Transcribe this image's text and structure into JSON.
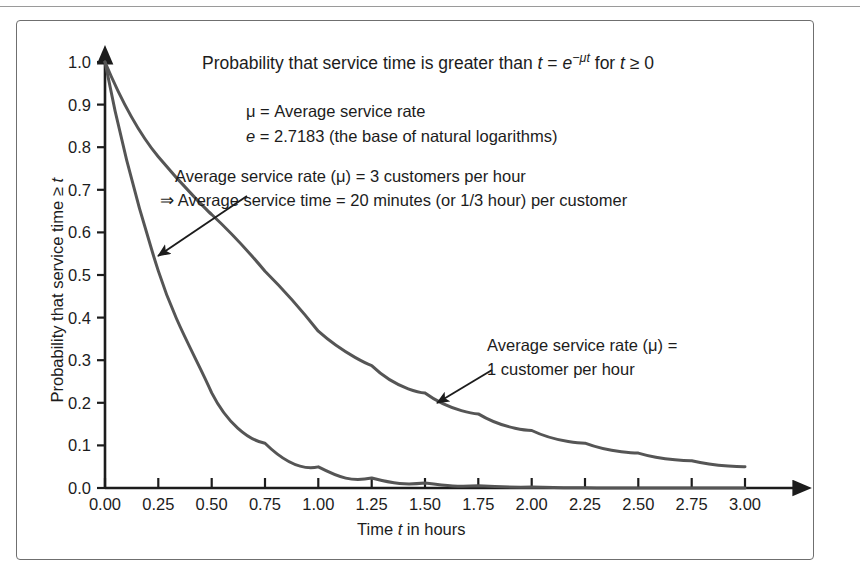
{
  "figure": {
    "title_plain": "Probability that service time is greater than t = e^(-μt) for t ≥ 0",
    "title_parts": {
      "a": "Probability that service time is greater than ",
      "t1": "t",
      "eq": " = ",
      "e": "e",
      "exp": "−μt",
      "b": " for ",
      "t2": "t",
      "c": " ≥ 0"
    },
    "notes": [
      "μ = Average service rate",
      "e = 2.7183 (the base of natural logarithms)"
    ],
    "note_e_parts": {
      "e": "e",
      "rest": " = 2.7183 (the base of natural logarithms)"
    },
    "annotations": [
      {
        "id": "mu3",
        "line1": "Average service rate (μ) = 3 customers per hour",
        "line2": "⇒ Average service time = 20 minutes (or 1/3 hour) per customer"
      },
      {
        "id": "mu1",
        "line1": "Average service rate (μ) =",
        "line2": "1 customer per hour"
      }
    ],
    "axis_titles": {
      "x": "Time t in hours",
      "x_parts": {
        "a": "Time ",
        "t": "t",
        "b": " in hours"
      },
      "y": "Probability that service time ≥ t",
      "y_parts": {
        "a": "Probability that service time ≥ ",
        "t": "t"
      }
    },
    "colors": {
      "curve": "#555555",
      "axis": "#1c1c1c",
      "frame": "#6f6f6f",
      "text": "#1c1c1c",
      "background": "#ffffff"
    }
  },
  "chart_data": {
    "type": "line",
    "xlabel": "Time t in hours",
    "ylabel": "Probability that service time ≥ t",
    "xlim": [
      0.0,
      3.0
    ],
    "ylim": [
      0.0,
      1.0
    ],
    "grid": false,
    "legend": "annotations with leader arrows (no legend box)",
    "xticks": [
      "0.00",
      "0.25",
      "0.50",
      "0.75",
      "1.00",
      "1.25",
      "1.50",
      "1.75",
      "2.00",
      "2.25",
      "2.50",
      "2.75",
      "3.00"
    ],
    "xtick_values": [
      0.0,
      0.25,
      0.5,
      0.75,
      1.0,
      1.25,
      1.5,
      1.75,
      2.0,
      2.25,
      2.5,
      2.75,
      3.0
    ],
    "yticks": [
      "0.0",
      "0.1",
      "0.2",
      "0.3",
      "0.4",
      "0.5",
      "0.6",
      "0.7",
      "0.8",
      "0.9",
      "1.0"
    ],
    "ytick_values": [
      0.0,
      0.1,
      0.2,
      0.3,
      0.4,
      0.5,
      0.6,
      0.7,
      0.8,
      0.9,
      1.0
    ],
    "x": [
      0.0,
      0.25,
      0.5,
      0.75,
      1.0,
      1.25,
      1.5,
      1.75,
      2.0,
      2.25,
      2.5,
      2.75,
      3.0
    ],
    "series": [
      {
        "name": "Average service rate (μ) = 1 customer per hour",
        "mu": 1,
        "formula": "e^(-1t)",
        "values": [
          1.0,
          0.779,
          0.607,
          0.472,
          0.368,
          0.287,
          0.223,
          0.174,
          0.135,
          0.105,
          0.082,
          0.064,
          0.05
        ]
      },
      {
        "name": "Average service rate (μ) = 3 customers per hour",
        "mu": 3,
        "formula": "e^(-3t)",
        "values": [
          1.0,
          0.472,
          0.223,
          0.105,
          0.05,
          0.024,
          0.011,
          0.005,
          0.0025,
          0.0012,
          0.0006,
          0.0003,
          0.0001
        ]
      }
    ]
  }
}
